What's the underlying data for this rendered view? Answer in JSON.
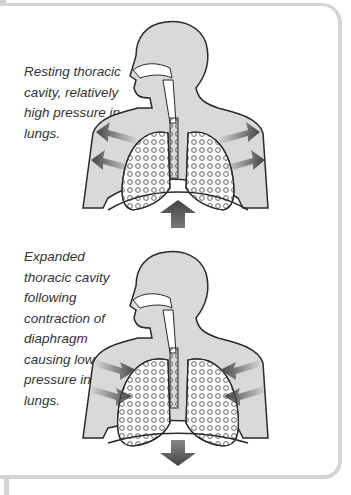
{
  "panel": {
    "border_color": "#d4d4d4",
    "background": "#ffffff"
  },
  "figures": [
    {
      "caption": "Resting thoracic cavity, relatively high pressure in lungs.",
      "state": "resting",
      "side_arrows": "outward",
      "diaphragm_arrow": "up"
    },
    {
      "caption": "Expanded thoracic cavity following contraction of diaphragm causing low air pressure in the lungs.",
      "state": "expanded",
      "side_arrows": "inward",
      "diaphragm_arrow": "down"
    }
  ],
  "colors": {
    "body_fill": "#d9d9d9",
    "outline": "#2a2a2a",
    "lung_fill": "#ffffff",
    "arrow": "#555555",
    "caption_text": "#333333"
  }
}
